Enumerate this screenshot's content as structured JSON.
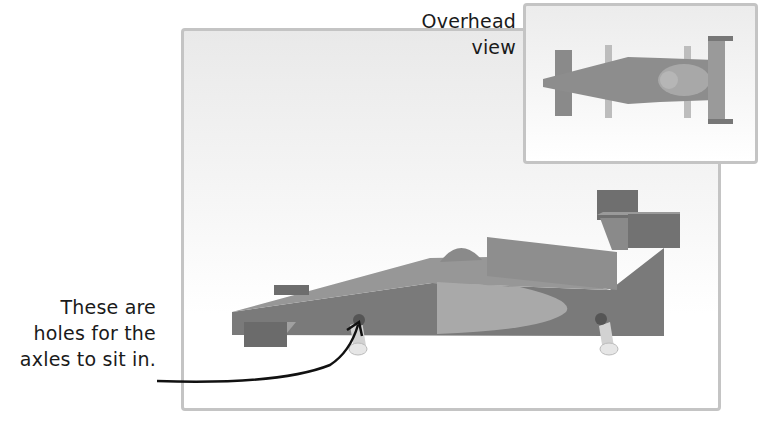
{
  "labels": {
    "overhead_line1": "Overhead",
    "overhead_line2": "view",
    "callout_line1": "These are",
    "callout_line2": "holes for the",
    "callout_line3": "axles to sit in."
  },
  "colors": {
    "panel_border": "#c4c4c4",
    "car_body": "#7d7d7d",
    "car_top": "#9a9a9a",
    "car_light": "#b5b5b5",
    "axle": "#d8d8d8",
    "arrow": "#111111",
    "text": "#1a1a1a"
  }
}
